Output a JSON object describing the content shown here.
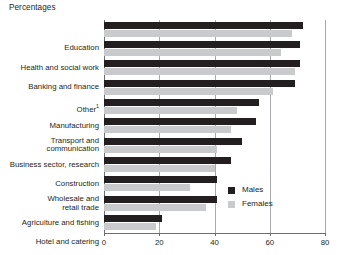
{
  "chart_data": {
    "type": "bar",
    "orientation": "horizontal",
    "title": "Percentages",
    "xlabel": "",
    "ylabel": "",
    "xlim": [
      0,
      80
    ],
    "xticks": [
      0,
      20,
      40,
      60,
      80
    ],
    "xtick_labels": [
      "0",
      "20",
      "40",
      "60",
      "80"
    ],
    "grid": "vertical",
    "legend_position": "inside-right-lower",
    "categories": [
      "Education",
      "Health and social work",
      "Banking and finance",
      "Other",
      "Manufacturing",
      "Transport and\ncommunication",
      "Business sector, research",
      "Construction",
      "Wholesale and\nretail trade",
      "Agriculture and fishing",
      "Hotel and catering"
    ],
    "category_footnotes": [
      "",
      "",
      "",
      "1",
      "",
      "",
      "",
      "",
      "",
      "",
      ""
    ],
    "series": [
      {
        "name": "Males",
        "color": "#231f20",
        "values": [
          72,
          71,
          71,
          69,
          56,
          55,
          50,
          46,
          41,
          41,
          21
        ]
      },
      {
        "name": "Females",
        "color": "#c9cacb",
        "values": [
          68,
          64,
          69,
          61,
          48,
          46,
          41,
          40,
          31,
          37,
          19
        ]
      }
    ]
  },
  "legend": {
    "items": [
      {
        "label": "Males",
        "color": "#231f20"
      },
      {
        "label": "Females",
        "color": "#c9cacb"
      }
    ]
  },
  "colors": {
    "males": "#231f20",
    "females": "#c9cacb",
    "gridline": "#a7a9ac",
    "axis": "#6d6e71",
    "text": "#231f20",
    "background": "#ffffff"
  }
}
